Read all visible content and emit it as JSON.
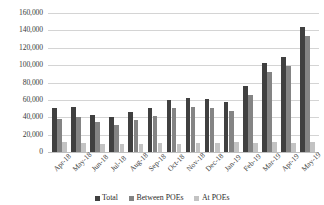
{
  "chart_data": {
    "type": "bar",
    "title": "",
    "subtitle": "",
    "xlabel": "",
    "ylabel": "",
    "ylim": [
      0,
      160000
    ],
    "grid": true,
    "legend_position": "bottom",
    "y_ticks": [
      "0",
      "20,000",
      "40,000",
      "60,000",
      "80,000",
      "100,000",
      "120,000",
      "140,000",
      "160,000"
    ],
    "y_tick_values": [
      0,
      20000,
      40000,
      60000,
      80000,
      100000,
      120000,
      140000,
      160000
    ],
    "categories": [
      "Apr-18",
      "May-18",
      "Jun-18",
      "Jul-18",
      "Aug-18",
      "Sep-18",
      "Oct-18",
      "Nov-18",
      "Dec-18",
      "Jan-19",
      "Feb-19",
      "Mar-19",
      "Apr-19",
      "May-19"
    ],
    "series": [
      {
        "name": "Total",
        "color": "#404040",
        "values": [
          51000,
          52000,
          43000,
          40000,
          46000,
          51000,
          60000,
          62000,
          61000,
          58000,
          76000,
          103000,
          109000,
          144000
        ]
      },
      {
        "name": "Between POEs",
        "color": "#848484",
        "values": [
          38000,
          40000,
          34000,
          31000,
          37000,
          41000,
          51000,
          52000,
          51000,
          47000,
          66000,
          92000,
          99000,
          133000
        ]
      },
      {
        "name": "At POEs",
        "color": "#c3c3c3",
        "values": [
          11000,
          10000,
          9000,
          9000,
          9000,
          10000,
          9000,
          10000,
          10000,
          11000,
          10000,
          11000,
          10000,
          11000
        ]
      }
    ]
  },
  "legend": {
    "items": [
      {
        "label": "Total",
        "color": "#404040"
      },
      {
        "label": "Between POEs",
        "color": "#848484"
      },
      {
        "label": "At POEs",
        "color": "#c3c3c3"
      }
    ]
  }
}
